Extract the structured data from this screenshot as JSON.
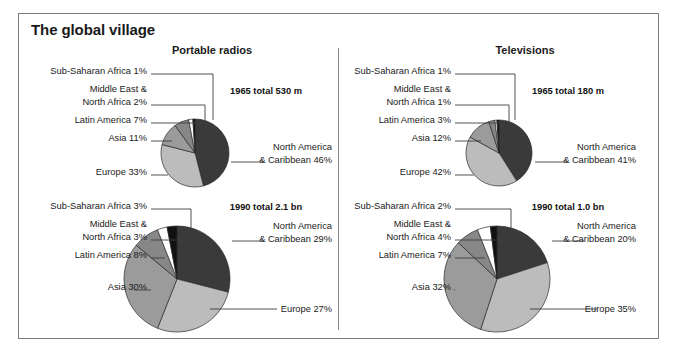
{
  "figure": {
    "title": "The global village",
    "panels": [
      {
        "id": "radios",
        "title": "Portable radios"
      },
      {
        "id": "tvs",
        "title": "Televisions"
      }
    ]
  },
  "chart_data": [
    {
      "type": "pie",
      "id": "radios-1965",
      "title": "Portable radios",
      "annotation": "1965 total 530 m",
      "total_label": "530 m",
      "year": "1965",
      "categories": [
        "North America & Caribbean",
        "Europe",
        "Asia",
        "Latin America",
        "Middle East & North Africa",
        "Sub-Saharan Africa"
      ],
      "values": [
        46,
        33,
        11,
        7,
        2,
        1
      ],
      "labels": [
        "North America\n& Caribbean 46%",
        "Europe 33%",
        "Asia 11%",
        "Latin America 7%",
        "Middle East &\nNorth Africa 2%",
        "Sub-Saharan Africa 1%"
      ],
      "colors": [
        "#3a3a3a",
        "#bcbcbc",
        "#9b9b9b",
        "#878787",
        "#ffffff",
        "#111111"
      ]
    },
    {
      "type": "pie",
      "id": "radios-1990",
      "title": "Portable radios",
      "annotation": "1990 total 2.1 bn",
      "total_label": "2.1 bn",
      "year": "1990",
      "categories": [
        "North America & Caribbean",
        "Europe",
        "Asia",
        "Latin America",
        "Middle East & North Africa",
        "Sub-Saharan Africa"
      ],
      "values": [
        29,
        27,
        30,
        8,
        3,
        3
      ],
      "labels": [
        "North America\n& Caribbean 29%",
        "Europe 27%",
        "Asia 30%",
        "Latin America 8%",
        "Middle East &\nNorth Africa 3%",
        "Sub-Saharan Africa 3%"
      ],
      "colors": [
        "#3a3a3a",
        "#bcbcbc",
        "#9b9b9b",
        "#878787",
        "#ffffff",
        "#111111"
      ]
    },
    {
      "type": "pie",
      "id": "tvs-1965",
      "title": "Televisions",
      "annotation": "1965 total 180 m",
      "total_label": "180 m",
      "year": "1965",
      "categories": [
        "North America & Caribbean",
        "Europe",
        "Asia",
        "Latin America",
        "Middle East & North Africa",
        "Sub-Saharan Africa"
      ],
      "values": [
        41,
        42,
        12,
        3,
        1,
        1
      ],
      "labels": [
        "North America\n& Caribbean 41%",
        "Europe 42%",
        "Asia 12%",
        "Latin America 3%",
        "Middle East &\nNorth Africa 1%",
        "Sub-Saharan Africa 1%"
      ],
      "colors": [
        "#3a3a3a",
        "#bcbcbc",
        "#9b9b9b",
        "#878787",
        "#ffffff",
        "#111111"
      ]
    },
    {
      "type": "pie",
      "id": "tvs-1990",
      "title": "Televisions",
      "annotation": "1990 total 1.0 bn",
      "total_label": "1.0 bn",
      "year": "1990",
      "categories": [
        "North America & Caribbean",
        "Europe",
        "Asia",
        "Latin America",
        "Middle East & North Africa",
        "Sub-Saharan Africa"
      ],
      "values": [
        20,
        35,
        32,
        7,
        4,
        2
      ],
      "labels": [
        "North America\n& Caribbean 20%",
        "Europe 35%",
        "Asia 32%",
        "Latin America 7%",
        "Middle East &\nNorth Africa 4%",
        "Sub-Saharan Africa 2%"
      ],
      "colors": [
        "#3a3a3a",
        "#bcbcbc",
        "#9b9b9b",
        "#878787",
        "#ffffff",
        "#111111"
      ]
    }
  ],
  "layout": {
    "charts": [
      {
        "id": "radios-1965",
        "cx": 176,
        "cy": 139,
        "r": 34,
        "annotation_x": 247,
        "annotation_y": 80,
        "left_label_x": 128,
        "right_label_x": 313,
        "left_rows": [
          {
            "label_index": 5,
            "ty": 60,
            "lines": 1,
            "lx": 194,
            "ly": 60,
            "vy": 106
          },
          {
            "label_index": 4,
            "ty": 78,
            "lines": 2,
            "lx": 186,
            "ly": 91,
            "vy": 108
          },
          {
            "label_index": 3,
            "ty": 109,
            "lines": 1,
            "lx": 178,
            "ly": 109,
            "vy": 112
          },
          {
            "label_index": 2,
            "ty": 127,
            "lines": 1,
            "lx": 153,
            "ly": 127,
            "vy": 127
          }
        ],
        "left_low": {
          "label_index": 1,
          "ty": 161,
          "lx": 149,
          "ly": 161
        },
        "right_row": {
          "label_index": 0,
          "ty": 136,
          "lx": 212,
          "rx": 245,
          "ly": 148
        }
      },
      {
        "id": "radios-1990",
        "cx": 158,
        "cy": 265,
        "r": 53,
        "annotation_x": 247,
        "annotation_y": 196,
        "left_label_x": 128,
        "right_label_x": 313,
        "left_rows": [
          {
            "label_index": 5,
            "ty": 195,
            "lines": 1,
            "lx": 172,
            "ly": 195,
            "vy": 224
          },
          {
            "label_index": 4,
            "ty": 213,
            "lines": 2,
            "lx": 163,
            "ly": 226,
            "vy": 228
          },
          {
            "label_index": 3,
            "ty": 244,
            "lines": 1,
            "lx": 146,
            "ly": 244,
            "vy": 244
          },
          {
            "label_index": 2,
            "ty": 276,
            "lines": 1,
            "lx": 115,
            "ly": 276,
            "vy": 276
          }
        ],
        "right_row": {
          "label_index": 0,
          "ty": 215,
          "lx": 213,
          "rx": 245,
          "ly": 227
        },
        "bottom_row": {
          "label_index": 1,
          "ty": 298,
          "lx": 191,
          "rx": 258,
          "ly": 295
        }
      },
      {
        "id": "tvs-1965",
        "cx": 480,
        "cy": 139,
        "r": 33,
        "annotation_x": 549,
        "annotation_y": 80,
        "left_label_x": 432,
        "right_label_x": 617,
        "left_rows": [
          {
            "label_index": 5,
            "ty": 60,
            "lines": 1,
            "lx": 496,
            "ly": 60,
            "vy": 106
          },
          {
            "label_index": 4,
            "ty": 78,
            "lines": 2,
            "lx": 490,
            "ly": 91,
            "vy": 108
          },
          {
            "label_index": 3,
            "ty": 109,
            "lines": 1,
            "lx": 482,
            "ly": 109,
            "vy": 111
          },
          {
            "label_index": 2,
            "ty": 127,
            "lines": 1,
            "lx": 462,
            "ly": 127,
            "vy": 127
          }
        ],
        "left_low": {
          "label_index": 1,
          "ty": 161,
          "lx": 455,
          "ly": 161
        },
        "right_row": {
          "label_index": 0,
          "ty": 136,
          "lx": 516,
          "rx": 549,
          "ly": 148
        }
      },
      {
        "id": "tvs-1990",
        "cx": 478,
        "cy": 265,
        "r": 53,
        "annotation_x": 549,
        "annotation_y": 196,
        "left_label_x": 432,
        "right_label_x": 617,
        "left_rows": [
          {
            "label_index": 5,
            "ty": 195,
            "lines": 1,
            "lx": 492,
            "ly": 195,
            "vy": 224
          },
          {
            "label_index": 4,
            "ty": 213,
            "lines": 2,
            "lx": 483,
            "ly": 226,
            "vy": 228
          },
          {
            "label_index": 3,
            "ty": 244,
            "lines": 1,
            "lx": 466,
            "ly": 244,
            "vy": 244
          },
          {
            "label_index": 2,
            "ty": 276,
            "lines": 1,
            "lx": 435,
            "ly": 276,
            "vy": 276
          }
        ],
        "right_row": {
          "label_index": 0,
          "ty": 215,
          "lx": 533,
          "rx": 565,
          "ly": 227
        },
        "bottom_row": {
          "label_index": 1,
          "ty": 298,
          "lx": 511,
          "rx": 578,
          "ly": 295
        }
      }
    ]
  }
}
